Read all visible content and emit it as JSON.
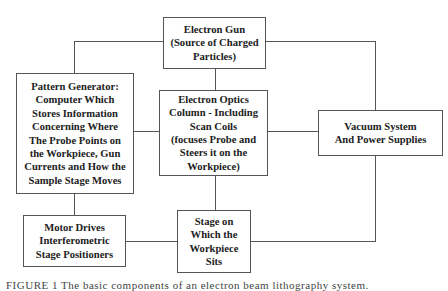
{
  "diagram": {
    "type": "block-diagram",
    "nodes": [
      {
        "id": "electron_gun",
        "label": "Electron Gun\n(Source of Charged\nParticles)"
      },
      {
        "id": "pattern_generator",
        "label": "Pattern Generator:\nComputer Which\nStores Information\nConcerning Where\nThe Probe Points on\nthe Workpiece, Gun\nCurrents and How the\nSample Stage Moves"
      },
      {
        "id": "electron_optics",
        "label": "Electron Optics\nColumn - Including\nScan Coils\n(focuses Probe and\nSteers it on the\nWorkpiece)"
      },
      {
        "id": "vacuum_system",
        "label": "Vacuum System\nAnd Power Supplies"
      },
      {
        "id": "motor_drives",
        "label": "Motor Drives\nInterferometric\nStage Positioners"
      },
      {
        "id": "stage",
        "label": "Stage on\nWhich the\nWorkpiece\nSits"
      }
    ],
    "edges": [
      [
        "electron_gun",
        "pattern_generator"
      ],
      [
        "electron_gun",
        "vacuum_system"
      ],
      [
        "electron_gun",
        "electron_optics"
      ],
      [
        "pattern_generator",
        "electron_optics"
      ],
      [
        "electron_optics",
        "vacuum_system"
      ],
      [
        "pattern_generator",
        "motor_drives"
      ],
      [
        "electron_optics",
        "stage"
      ],
      [
        "motor_drives",
        "stage"
      ],
      [
        "vacuum_system",
        "stage"
      ]
    ],
    "caption": "FIGURE 1  The  basic  components  of  an  electron  beam  lithography  system."
  }
}
